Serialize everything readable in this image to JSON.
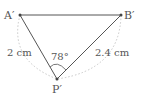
{
  "points": {
    "A": {
      "label": "A′",
      "x": 20,
      "y": 15
    },
    "B": {
      "label": "B′",
      "x": 121,
      "y": 15
    },
    "P": {
      "label": "P′",
      "x": 57,
      "y": 79
    }
  },
  "measurements": {
    "PA": "2 cm",
    "PB": "2.4 cm",
    "angle_P": "78°"
  },
  "colors": {
    "line": "#555555",
    "arc": "#c8c8c8",
    "text": "#555555"
  }
}
